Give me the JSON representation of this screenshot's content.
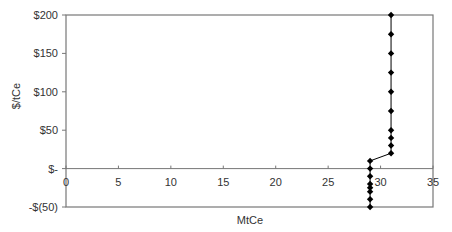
{
  "chart_data": {
    "type": "line",
    "title": "",
    "xlabel": "MtCe",
    "ylabel": "$/tCe",
    "xlim": [
      0,
      35
    ],
    "ylim": [
      -50,
      200
    ],
    "x_ticks": [
      0,
      5,
      10,
      15,
      20,
      25,
      30,
      35
    ],
    "x_tick_labels": [
      "0",
      "5",
      "10",
      "15",
      "20",
      "25",
      "30",
      "35"
    ],
    "y_ticks": [
      200,
      150,
      100,
      50,
      0,
      -50
    ],
    "y_tick_labels": [
      "$200",
      "$150",
      "$100",
      "$50",
      "$-",
      "-$(50)"
    ],
    "grid": false,
    "legend": null,
    "series": [
      {
        "name": "Marginal abatement cost curve",
        "marker": "diamond",
        "color": "#000000",
        "points": [
          {
            "x": 29,
            "y": -50
          },
          {
            "x": 29,
            "y": -40
          },
          {
            "x": 29,
            "y": -30
          },
          {
            "x": 29,
            "y": -25
          },
          {
            "x": 29,
            "y": -20
          },
          {
            "x": 29,
            "y": -10
          },
          {
            "x": 29,
            "y": 0
          },
          {
            "x": 29,
            "y": 10
          },
          {
            "x": 31,
            "y": 20
          },
          {
            "x": 31,
            "y": 30
          },
          {
            "x": 31,
            "y": 40
          },
          {
            "x": 31,
            "y": 50
          },
          {
            "x": 31,
            "y": 75
          },
          {
            "x": 31,
            "y": 100
          },
          {
            "x": 31,
            "y": 125
          },
          {
            "x": 31,
            "y": 150
          },
          {
            "x": 31,
            "y": 175
          },
          {
            "x": 31,
            "y": 200
          }
        ]
      }
    ]
  }
}
